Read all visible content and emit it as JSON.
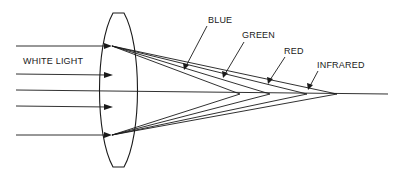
{
  "diagram": {
    "type": "chromatic-aberration-lens",
    "labels": {
      "incoming": "WHITE LIGHT",
      "blue": "BLUE",
      "green": "GREEN",
      "red": "RED",
      "infrared": "INFRARED"
    },
    "colors": {
      "line": "#1a1a1a",
      "background": "#ffffff"
    },
    "incoming_rays_y": [
      46,
      74,
      90,
      106,
      135
    ],
    "focal_points_x": {
      "blue": 240,
      "green": 270,
      "red": 307,
      "infrared": 337
    },
    "axis_y": 93
  }
}
